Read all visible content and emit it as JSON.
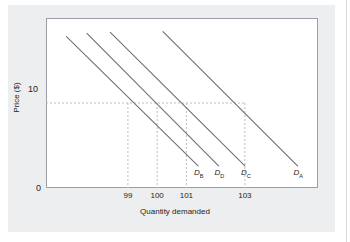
{
  "chart_data": {
    "type": "line",
    "title": "",
    "xlabel": "Quantity demanded",
    "ylabel": "Price ($)",
    "xlim": [
      96.2,
      105.5
    ],
    "ylim": [
      0,
      20
    ],
    "grid": "dashed-guides",
    "legend": "inline-curve-labels",
    "y_ticks": [
      {
        "label": "10",
        "value": 10
      }
    ],
    "origin_label": "0",
    "x_ticks": [
      {
        "label": "99",
        "value": 99
      },
      {
        "label": "100",
        "value": 100
      },
      {
        "label": "101",
        "value": 101
      },
      {
        "label": "103",
        "value": 103
      }
    ],
    "guide_price": 10,
    "guide_quantities": [
      99,
      100,
      101,
      103
    ],
    "series": [
      {
        "name": "D_B",
        "label_base": "D",
        "label_sub": "B",
        "quantity_at_price_10": 99,
        "points": [
          {
            "x": 96.9,
            "y": 17.8
          },
          {
            "x": 101.4,
            "y": 2.6
          }
        ]
      },
      {
        "name": "D_D",
        "label_base": "D",
        "label_sub": "D",
        "quantity_at_price_10": 100,
        "points": [
          {
            "x": 97.6,
            "y": 18.2
          },
          {
            "x": 102.1,
            "y": 2.6
          }
        ]
      },
      {
        "name": "D_C",
        "label_base": "D",
        "label_sub": "C",
        "quantity_at_price_10": 101,
        "points": [
          {
            "x": 98.4,
            "y": 18.3
          },
          {
            "x": 103.0,
            "y": 2.6
          }
        ]
      },
      {
        "name": "D_A",
        "label_base": "D",
        "label_sub": "A",
        "quantity_at_price_10": 103,
        "points": [
          {
            "x": 100.2,
            "y": 18.4
          },
          {
            "x": 104.8,
            "y": 2.6
          }
        ]
      }
    ],
    "colors": {
      "curve": "#6d7275",
      "guide": "#b9bdc0",
      "frame": "#9aa0a6",
      "text": "#231f20",
      "panel_background": "#eceeef",
      "plot_background": "#ffffff"
    }
  }
}
